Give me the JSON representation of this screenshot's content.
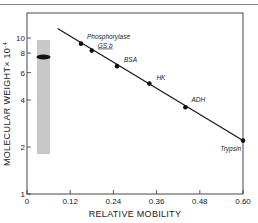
{
  "chart_data": {
    "type": "scatter",
    "title": "",
    "xlabel": "RELATIVE MOBILITY",
    "ylabel": "MOLECULAR WEIGHT× 10",
    "ylabel_exponent": "-4",
    "yscale": "log",
    "xlim": [
      0,
      0.6
    ],
    "ylim": [
      1,
      10
    ],
    "x_ticks": [
      0,
      0.12,
      0.24,
      0.36,
      0.48,
      0.6
    ],
    "x_tick_labels": [
      "0",
      "0.12",
      "0.24",
      "0.36",
      "0.48",
      "0.60"
    ],
    "y_ticks": [
      1,
      2,
      4,
      6,
      8,
      10
    ],
    "y_tick_labels": [
      "1",
      "2",
      "4",
      "6",
      "8",
      "10"
    ],
    "grid": false,
    "series": [
      {
        "name": "Standard proteins",
        "points": [
          {
            "label": "Phosphorylase",
            "x": 0.15,
            "y": 9.2
          },
          {
            "label": "GS b",
            "x": 0.18,
            "y": 8.3
          },
          {
            "label": "BSA",
            "x": 0.25,
            "y": 6.6
          },
          {
            "label": "HK",
            "x": 0.34,
            "y": 5.1
          },
          {
            "label": "ADH",
            "x": 0.44,
            "y": 3.6
          },
          {
            "label": "Trypsin",
            "x": 0.6,
            "y": 2.2
          }
        ]
      }
    ],
    "fit_line": {
      "x_start": 0.085,
      "y_start": 11.5,
      "x_end": 0.6,
      "y_end": 2.2
    },
    "inset": {
      "type": "gel-lane",
      "band_y": 7.6,
      "lane_y_range": [
        1.85,
        9.8
      ]
    }
  },
  "labels": {
    "x_axis_title": "RELATIVE MOBILITY",
    "y_axis_title_main": "MOLECULAR WEIGHT× 10",
    "y_axis_title_exp": "-4",
    "points": [
      "Phosphorylase",
      "GS b",
      "BSA",
      "HK",
      "ADH",
      "Trypsin"
    ],
    "x_ticks": [
      "0",
      "0.12",
      "0.24",
      "0.36",
      "0.48",
      "0.60"
    ],
    "y_ticks": [
      "1",
      "2",
      "4",
      "6",
      "8",
      "10"
    ]
  }
}
